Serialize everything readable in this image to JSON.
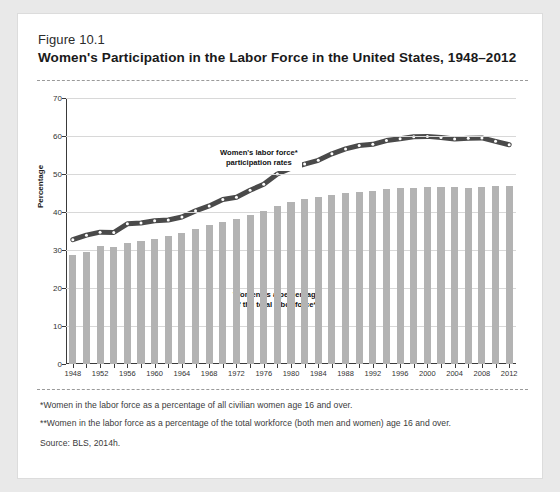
{
  "figure": {
    "number": "Figure 10.1",
    "title": "Women's Participation in the Labor Force in the United States, 1948–2012"
  },
  "footnotes": {
    "single_star": "*Women in the labor force as a percentage of all civilian women age 16 and over.",
    "double_star": "**Women in the labor force as a percentage of the total workforce (both men and women) age 16 and over.",
    "source": "Source: BLS, 2014h."
  },
  "colors": {
    "bar": "#b3b3b3",
    "line": "#4a4a4a",
    "marker": "#ffffff",
    "grid": "#d8d8d8",
    "axis": "#3a3a3a",
    "page_bg": "#e9e9e9",
    "card_bg": "#ffffff"
  },
  "chart_data": {
    "type": "bar",
    "title": "Women's Participation in the Labor Force in the United States, 1948–2012",
    "xlabel": "",
    "ylabel": "Percentage",
    "ylim": [
      0,
      70
    ],
    "yticks": [
      0,
      10,
      20,
      30,
      40,
      50,
      60,
      70
    ],
    "grid": true,
    "legend": "annotations",
    "xticks": [
      1948,
      1952,
      1956,
      1960,
      1964,
      1968,
      1972,
      1976,
      1980,
      1984,
      1988,
      1992,
      1996,
      2000,
      2004,
      2008,
      2012
    ],
    "categories": [
      1948,
      1950,
      1952,
      1954,
      1956,
      1958,
      1960,
      1962,
      1964,
      1966,
      1968,
      1970,
      1972,
      1974,
      1976,
      1978,
      1980,
      1982,
      1984,
      1986,
      1988,
      1990,
      1992,
      1994,
      1996,
      1998,
      2000,
      2002,
      2004,
      2006,
      2008,
      2010,
      2012
    ],
    "series": [
      {
        "name": "Women as a percentage of the total labor force**",
        "type": "bar",
        "annotation": "Women as a percentage\nof the total labor force**",
        "values": [
          28.6,
          29.6,
          31.0,
          30.8,
          31.9,
          32.3,
          33.0,
          33.8,
          34.4,
          35.6,
          36.5,
          37.4,
          38.2,
          39.1,
          40.3,
          41.7,
          42.6,
          43.5,
          43.9,
          44.6,
          45.1,
          45.3,
          45.6,
          46.1,
          46.3,
          46.4,
          46.6,
          46.7,
          46.5,
          46.4,
          46.6,
          46.8,
          46.9
        ]
      },
      {
        "name": "Women's labor force* participation rates",
        "type": "line",
        "annotation": "Women's labor force*\nparticipation rates",
        "values": [
          32.7,
          33.9,
          34.7,
          34.6,
          36.9,
          37.1,
          37.7,
          37.9,
          38.7,
          40.3,
          41.6,
          43.3,
          43.9,
          45.7,
          47.3,
          50.0,
          51.5,
          52.6,
          53.6,
          55.3,
          56.6,
          57.5,
          57.8,
          58.8,
          59.3,
          59.8,
          59.9,
          59.6,
          59.2,
          59.4,
          59.5,
          58.6,
          57.7
        ]
      }
    ]
  }
}
